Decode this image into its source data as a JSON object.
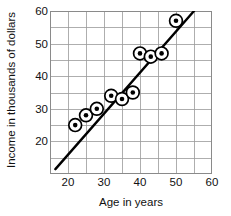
{
  "chart_data": {
    "type": "scatter",
    "title": "",
    "xlabel": "Age in years",
    "ylabel": "Income in thousands of dollars",
    "xlim": [
      15,
      60
    ],
    "ylim": [
      10,
      60
    ],
    "xticks": [
      20,
      30,
      40,
      50,
      60
    ],
    "yticks": [
      20,
      30,
      40,
      50,
      60
    ],
    "xtick_labels": [
      "20",
      "30",
      "40",
      "50",
      "60"
    ],
    "ytick_labels": [
      "20",
      "30",
      "40",
      "50",
      "60"
    ],
    "grid": true,
    "grid_step_x": 5,
    "grid_step_y": 5,
    "legend": "none",
    "marker_style": "dot-in-circle",
    "points": [
      {
        "x": 22,
        "y": 25
      },
      {
        "x": 25,
        "y": 28
      },
      {
        "x": 28,
        "y": 30
      },
      {
        "x": 32,
        "y": 34
      },
      {
        "x": 35,
        "y": 33
      },
      {
        "x": 38,
        "y": 35
      },
      {
        "x": 40,
        "y": 47
      },
      {
        "x": 43,
        "y": 46
      },
      {
        "x": 46,
        "y": 47
      },
      {
        "x": 50,
        "y": 57
      }
    ],
    "trend_line": {
      "type": "linear",
      "x_start": 16.5,
      "y_start": 11.5,
      "x_end": 55.0,
      "y_end": 60.0,
      "color": "#000000"
    },
    "colors": {
      "marker_fill": "#000000",
      "marker_ring": "#000000",
      "grid": "#999999",
      "axis": "#777777",
      "text": "#111111",
      "background": "#ffffff"
    }
  }
}
